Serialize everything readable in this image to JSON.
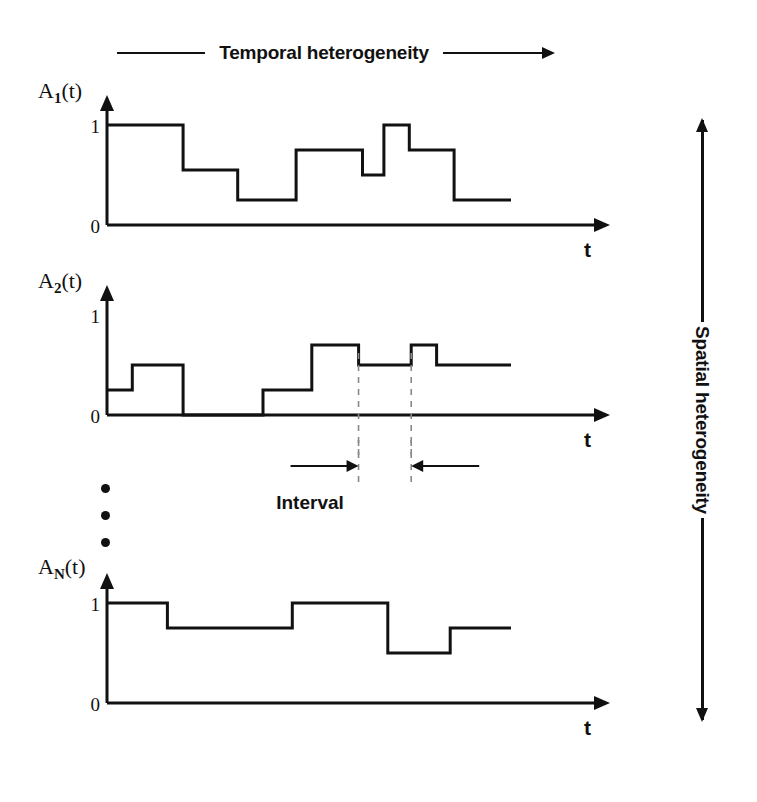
{
  "header": {
    "title": "Temporal heterogeneity",
    "left_rule": true,
    "right_arrow": "arrow-right"
  },
  "spatial": {
    "title": "Spatial heterogeneity",
    "arrow": "double-headed-vertical-arrow"
  },
  "annotation": {
    "interval_label": "Interval",
    "left_arrow": "arrow-right-icon",
    "right_arrow": "arrow-left-icon"
  },
  "ellipsis": {
    "dots": 3,
    "meaning": "series continues"
  },
  "axis": {
    "x_label": "t",
    "y_ticks": [
      "1",
      "0"
    ],
    "y_tick_values": [
      1,
      0
    ]
  },
  "chart_data": [
    {
      "type": "line",
      "subtype": "step",
      "title": "A1(t)",
      "ylabel": "A₁(t)",
      "ylabel_base": "A",
      "ylabel_sub": "1",
      "ylabel_suffix": "(t)",
      "xlabel": "t",
      "ylim": [
        0,
        1.15
      ],
      "xlim": [
        0,
        100
      ],
      "grid": false,
      "x_edges": [
        0,
        19.5,
        33.5,
        48.5,
        65.5,
        71.0,
        77.5,
        89.0,
        100.0
      ],
      "values": [
        1.0,
        0.55,
        0.25,
        0.75,
        0.5,
        1.0,
        0.75,
        0.25
      ],
      "tick_labels": [
        "1",
        "0"
      ]
    },
    {
      "type": "line",
      "subtype": "step",
      "title": "A2(t)",
      "ylabel": "A₂(t)",
      "ylabel_base": "A",
      "ylabel_sub": "2",
      "ylabel_suffix": "(t)",
      "xlabel": "t",
      "ylim": [
        0,
        1.15
      ],
      "xlim": [
        0,
        100
      ],
      "grid": false,
      "x_edges": [
        0,
        6.5,
        19.5,
        40.0,
        52.5,
        64.5,
        78.0,
        84.5,
        100.0
      ],
      "values": [
        0.25,
        0.5,
        0.0,
        0.25,
        0.7,
        0.5,
        0.7,
        0.5
      ],
      "tick_labels": [
        "1",
        "0"
      ],
      "dashed_markers": [
        64.5,
        78.0
      ]
    },
    {
      "type": "line",
      "subtype": "step",
      "title": "AN(t)",
      "ylabel": "Aₙ(t)",
      "ylabel_base": "A",
      "ylabel_sub": "N",
      "ylabel_suffix": "(t)",
      "xlabel": "t",
      "ylim": [
        0,
        1.15
      ],
      "xlim": [
        0,
        100
      ],
      "grid": false,
      "x_edges": [
        0,
        15.5,
        47.5,
        72.0,
        88.0,
        100.0
      ],
      "values": [
        1.0,
        0.75,
        1.0,
        0.5,
        0.75
      ],
      "tick_labels": [
        "1",
        "0"
      ]
    }
  ],
  "style": {
    "stroke": "#111111",
    "background": "#ffffff",
    "line_width": 3
  }
}
